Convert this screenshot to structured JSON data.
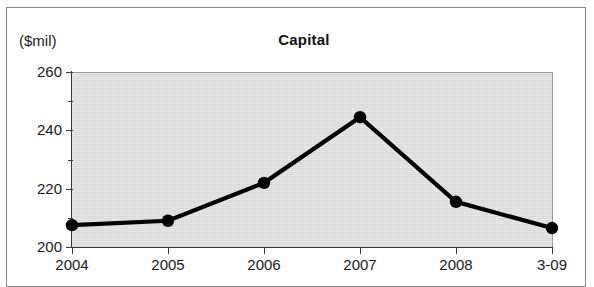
{
  "figure": {
    "unit_label": "($mil)",
    "title": "Capital"
  },
  "chart_data": {
    "type": "line",
    "title": "Capital",
    "xlabel": "",
    "ylabel": "($mil)",
    "categories": [
      "2004",
      "2005",
      "2006",
      "2007",
      "2008",
      "3-09"
    ],
    "values": [
      207.5,
      209,
      222,
      244.5,
      215.5,
      206.5
    ],
    "series": [
      {
        "name": "Capital",
        "values": [
          207.5,
          209,
          222,
          244.5,
          215.5,
          206.5
        ]
      }
    ],
    "ylim": [
      200,
      260
    ],
    "y_major_ticks": [
      200,
      220,
      240,
      260
    ],
    "y_minor_ticks": [
      210,
      230,
      250
    ],
    "y_tick_labels": [
      "200",
      "220",
      "240",
      "260"
    ],
    "grid": false,
    "legend": "none",
    "plot_background": "#d6d6d6",
    "line_color": "#000000",
    "marker_color": "#000000"
  }
}
